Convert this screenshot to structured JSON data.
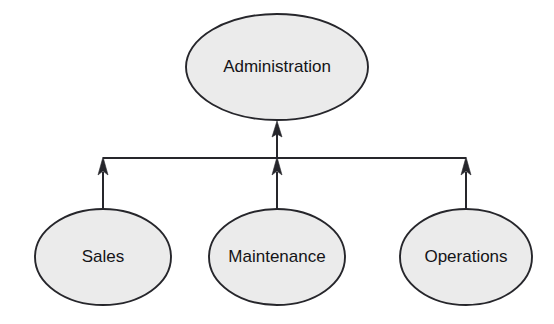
{
  "diagram": {
    "type": "hierarchy-tree",
    "canvas": {
      "width": 554,
      "height": 324,
      "background": "#ffffff"
    },
    "style": {
      "node_fill": "#ebebeb",
      "node_stroke": "#26262b",
      "label_color": "#141417",
      "connector_color": "#26262b"
    },
    "nodes": [
      {
        "id": "administration",
        "label": "Administration",
        "role": "parent",
        "cx": 277,
        "cy": 67,
        "rx": 91,
        "ry": 53
      },
      {
        "id": "sales",
        "label": "Sales",
        "role": "child",
        "cx": 103,
        "cy": 257,
        "rx": 68,
        "ry": 48
      },
      {
        "id": "maintenance",
        "label": "Maintenance",
        "role": "child",
        "cx": 277,
        "cy": 257,
        "rx": 68,
        "ry": 48
      },
      {
        "id": "operations",
        "label": "Operations",
        "role": "child",
        "cx": 466,
        "cy": 257,
        "rx": 66,
        "ry": 48
      }
    ],
    "bus": {
      "id": "horizontal-bus",
      "y": 158,
      "x_start": 103,
      "x_end": 466
    },
    "connectors": [
      {
        "id": "bus-to-administration",
        "from": "horizontal-bus",
        "to": "administration",
        "direction": "up",
        "x": 277,
        "y_tail": 158,
        "y_tip": 121,
        "arrowhead": true
      },
      {
        "id": "sales-to-bus",
        "from": "sales",
        "to": "horizontal-bus",
        "direction": "up",
        "x": 103,
        "y_tail": 209,
        "y_tip": 157,
        "arrowhead": true
      },
      {
        "id": "maintenance-to-bus",
        "from": "maintenance",
        "to": "horizontal-bus",
        "direction": "up",
        "x": 277,
        "y_tail": 209,
        "y_tip": 157,
        "arrowhead": true
      },
      {
        "id": "operations-to-bus",
        "from": "operations",
        "to": "horizontal-bus",
        "direction": "up",
        "x": 466,
        "y_tail": 209,
        "y_tip": 157,
        "arrowhead": true
      }
    ]
  }
}
